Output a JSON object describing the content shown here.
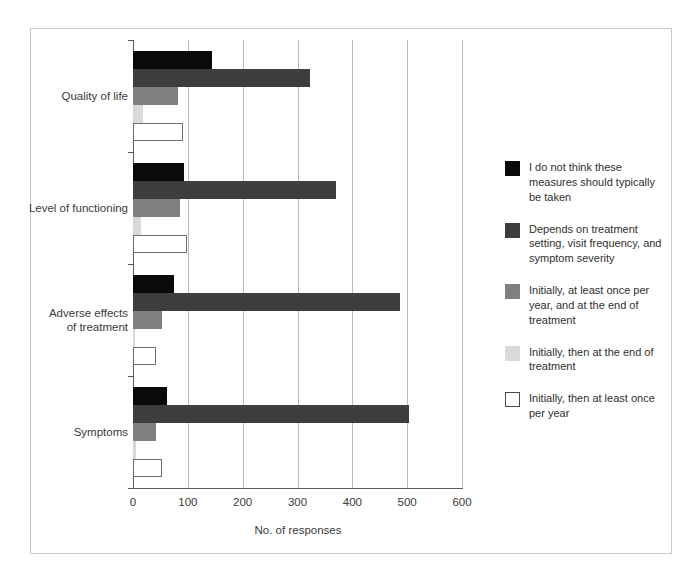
{
  "chart_data": {
    "type": "bar",
    "orientation": "horizontal",
    "title": "",
    "xlabel": "No. of responses",
    "ylabel": "",
    "xlim": [
      0,
      600
    ],
    "xticks": [
      0,
      100,
      200,
      300,
      400,
      500,
      600
    ],
    "grid": "vertical",
    "legend_position": "right",
    "categories": [
      "Quality of life",
      "Level of functioning",
      "Adverse effects of treatment",
      "Symptoms"
    ],
    "category_label_lines": [
      [
        "Quality of life"
      ],
      [
        "Level of functioning"
      ],
      [
        "Adverse effects",
        "of treatment"
      ],
      [
        "Symptoms"
      ]
    ],
    "series": [
      {
        "name": "I do not think these measures should typically be taken",
        "color": "#0a0a0a",
        "swatch": "sw-black",
        "values": [
          144,
          93,
          74,
          62
        ]
      },
      {
        "name": "Depends on treatment setting, visit frequency, and symptom severity",
        "color": "#3d3d3d",
        "swatch": "sw-darkgray",
        "values": [
          322,
          370,
          487,
          503
        ]
      },
      {
        "name": "Initially, at least once per year, and at the end of treatment",
        "color": "#808080",
        "swatch": "sw-medgray",
        "values": [
          82,
          86,
          52,
          42
        ]
      },
      {
        "name": "Initially, then at the end of treatment",
        "color": "#d9d9d9",
        "swatch": "sw-lightgray",
        "values": [
          18,
          14,
          3,
          6
        ]
      },
      {
        "name": "Initially, then at least once per year",
        "color": "#ffffff",
        "swatch": "sw-white",
        "values": [
          91,
          98,
          42,
          52
        ]
      }
    ]
  },
  "legend": {
    "items": [
      {
        "label": "I do not think these measures should typically be taken",
        "swatch": "sw-black"
      },
      {
        "label": "Depends on treatment setting, visit frequency, and symptom severity",
        "swatch": "sw-darkgray"
      },
      {
        "label": "Initially, at least once per year, and at the end of treatment",
        "swatch": "sw-medgray"
      },
      {
        "label": "Initially, then at the end of treatment",
        "swatch": "sw-lightgray"
      },
      {
        "label": "Initially, then at least once per year",
        "swatch": "sw-white"
      }
    ]
  },
  "colors": {
    "black": "#0a0a0a",
    "dark_gray": "#3d3d3d",
    "medium_gray": "#808080",
    "light_gray": "#d9d9d9",
    "white": "#ffffff",
    "gridline": "#b8b8b8",
    "axis": "#5a5a5a",
    "frame": "#c9c9c9",
    "text": "#3a3a3a"
  }
}
